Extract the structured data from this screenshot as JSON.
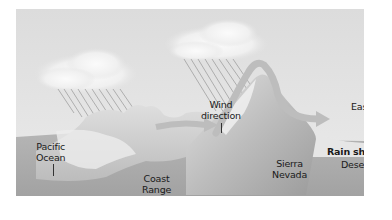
{
  "diagram": {
    "topic": "Rain shadow effect",
    "labels": {
      "pacific_ocean_line1": "Pacific",
      "pacific_ocean_line2": "Ocean",
      "wind_direction_line1": "Wind",
      "wind_direction_line2": "direction",
      "east": "East",
      "rain_shadow": "Rain shadow",
      "desert": "Desert",
      "coast_range_line1": "Coast",
      "coast_range_line2": "Range",
      "sierra_nevada_line1": "Sierra",
      "sierra_nevada_line2": "Nevada"
    },
    "elements": [
      {
        "name": "cloud-left",
        "icon": "cloud-icon"
      },
      {
        "name": "cloud-right",
        "icon": "cloud-icon"
      },
      {
        "name": "rain-left",
        "icon": "rain-icon"
      },
      {
        "name": "rain-right",
        "icon": "rain-icon"
      },
      {
        "name": "wind-arrow",
        "icon": "arrow-right-icon"
      },
      {
        "name": "coast-range-mountains"
      },
      {
        "name": "sierra-nevada-mountains"
      },
      {
        "name": "ocean"
      },
      {
        "name": "desert-plain"
      }
    ],
    "colors": {
      "sky": "#e4e4e4",
      "cloud": "#f4f4f4",
      "ground": "#a9a9a9",
      "mountain_light": "#d6d6d6",
      "wind_arrow": "#b8b8b8",
      "text": "#1a1a1a"
    }
  }
}
